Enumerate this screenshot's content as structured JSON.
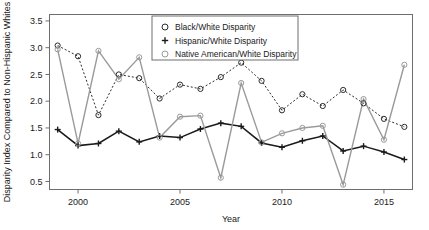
{
  "chart_data": {
    "type": "line",
    "title": "",
    "xlabel": "Year",
    "ylabel": "Disparity Index Compared to Non-Hispanic Whites",
    "xlim": [
      1998.6,
      2016.4
    ],
    "ylim": [
      0.35,
      3.62
    ],
    "grid": false,
    "legend_position": "top-center",
    "xticks": [
      2000,
      2005,
      2010,
      2015
    ],
    "xtick_labels": [
      "2000",
      "2005",
      "2010",
      "2015"
    ],
    "yticks": [
      0.5,
      1.0,
      1.5,
      2.0,
      2.5,
      3.0,
      3.5
    ],
    "ytick_labels": [
      "0.5",
      "1.0",
      "1.5",
      "2.0",
      "2.5",
      "3.0",
      "3.5"
    ],
    "x": [
      1999,
      2000,
      2001,
      2002,
      2003,
      2004,
      2005,
      2006,
      2007,
      2008,
      2009,
      2010,
      2011,
      2012,
      2013,
      2014,
      2015,
      2016
    ],
    "series": [
      {
        "name": "Black/White Disparity",
        "marker": "circle-open",
        "linestyle": "dotted",
        "color": "#2b2b2b",
        "values": [
          3.04,
          2.84,
          1.74,
          2.5,
          2.43,
          2.05,
          2.31,
          2.23,
          2.45,
          2.72,
          2.38,
          1.83,
          2.13,
          1.91,
          2.21,
          1.96,
          1.67,
          1.52
        ]
      },
      {
        "name": "Hispanic/White Disparity",
        "marker": "plus",
        "linestyle": "solid",
        "color": "#1a1a1a",
        "values": [
          1.47,
          1.17,
          1.21,
          1.44,
          1.24,
          1.35,
          1.32,
          1.48,
          1.59,
          1.53,
          1.22,
          1.14,
          1.26,
          1.35,
          1.07,
          1.16,
          1.05,
          0.91
        ]
      },
      {
        "name": "Native American/White Disparity",
        "marker": "circle-open",
        "linestyle": "solid",
        "color": "#9a9a9a",
        "values": [
          2.97,
          1.21,
          2.94,
          2.41,
          2.82,
          1.32,
          1.71,
          1.73,
          0.57,
          2.34,
          1.23,
          1.4,
          1.5,
          1.54,
          0.44,
          2.04,
          1.28,
          2.68
        ]
      }
    ]
  },
  "legend": {
    "entries": [
      {
        "label": "Black/White Disparity",
        "symbol": "circle-open-dark"
      },
      {
        "label": "Hispanic/White Disparity",
        "symbol": "plus-dark"
      },
      {
        "label": "Native American/White Disparity",
        "symbol": "circle-open-gray"
      }
    ]
  },
  "colors": {
    "black_white": "#2b2b2b",
    "hispanic_white": "#1a1a1a",
    "native_american_white": "#9a9a9a",
    "axis": "#6e6e6e",
    "background": "#ffffff"
  }
}
